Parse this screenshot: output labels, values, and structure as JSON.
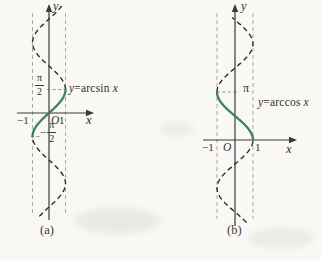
{
  "figure": {
    "description_visible_text_only": "",
    "background": "#f9f8f4"
  },
  "colors": {
    "background": "#f9f8f4",
    "axis": "#3b3a37",
    "dashed_curve": "#2e2c29",
    "solid_curve": "#3d8160",
    "unit_guide": "#a29f96",
    "value_guide": "#8f8d85",
    "text": "#33312e"
  },
  "panel_a": {
    "caption": "(a)",
    "y_axis_label": "y",
    "x_axis_label": "x",
    "origin_label": "O",
    "tick_neg1": "−1",
    "tick_pos1": "1",
    "y_tick_upper": {
      "num": "π",
      "den": "2"
    },
    "y_tick_lower": {
      "sign": "−",
      "num": "π",
      "den": "2"
    },
    "curve_label": {
      "lhs": "y",
      "mid": "=arcsin",
      "rhs": "x"
    }
  },
  "panel_b": {
    "caption": "(b)",
    "y_axis_label": "y",
    "x_axis_label": "x",
    "origin_label": "O",
    "tick_neg1": "−1",
    "tick_pos1": "1",
    "y_tick_pi": "π",
    "curve_label": {
      "lhs": "y",
      "mid": "=arccos",
      "rhs": "x"
    }
  },
  "chart_data": {
    "type": "line",
    "panels": [
      {
        "id": "a",
        "caption": "(a)",
        "solid_function": "y = arcsin x",
        "dashed_function": "x = sin y",
        "fn": "sin",
        "solid_t_pi": [
          -0.5,
          0.5
        ],
        "dashed_t_pi": [
          -2.2,
          2.3
        ],
        "domain_x": [
          -1,
          1
        ],
        "range_y_pi": [
          -0.5,
          0.5
        ],
        "x_ticks": [
          -1,
          0,
          1
        ],
        "y_tick_values_pi": [
          0.5,
          -0.5
        ],
        "y_tick_labels": [
          "π/2",
          "−π/2"
        ],
        "unit_guides_x": [
          -1,
          1
        ]
      },
      {
        "id": "b",
        "caption": "(b)",
        "solid_function": "y = arccos x",
        "dashed_function": "x = cos y",
        "fn": "cos",
        "solid_t_pi": [
          0,
          1
        ],
        "dashed_t_pi": [
          -1.72,
          2.55
        ],
        "domain_x": [
          -1,
          1
        ],
        "range_y_pi": [
          0,
          1
        ],
        "x_ticks": [
          -1,
          0,
          1
        ],
        "y_tick_values_pi": [
          1
        ],
        "y_tick_labels": [
          "π"
        ],
        "unit_guides_x": [
          -1,
          1
        ]
      }
    ]
  }
}
